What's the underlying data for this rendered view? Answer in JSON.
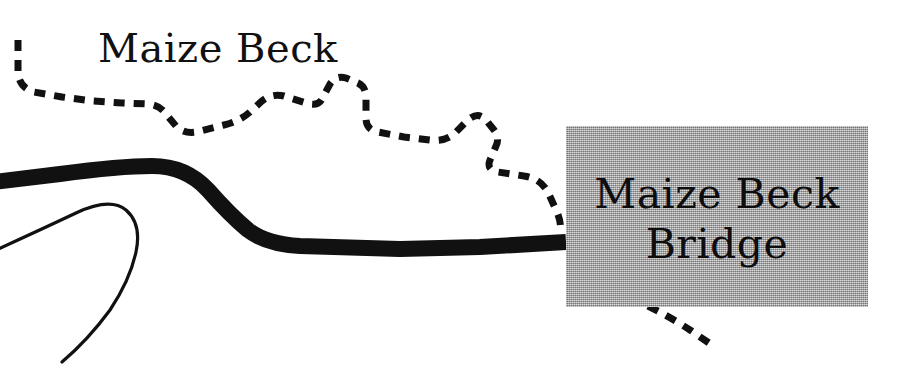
{
  "figure": {
    "name": "maize-beck-bridge-map-detail",
    "width": 918,
    "height": 380,
    "background_color": "#ffffff"
  },
  "labels": {
    "stream_label": "Maize Beck",
    "bridge_label_line1": "Maize Beck",
    "bridge_label_line2": "Bridge"
  },
  "callout_box": {
    "name": "bridge-callout-box",
    "fill_color": "#a9a9a9",
    "x": 566,
    "y": 126,
    "width": 302,
    "height": 181
  },
  "features": [
    {
      "name": "road",
      "style": "thick-solid",
      "color": "#111111",
      "stroke_width": 15
    },
    {
      "name": "stream",
      "style": "dashed",
      "color": "#111111",
      "stroke_width": 7,
      "dash_pattern": "11 9"
    },
    {
      "name": "footpath-loop",
      "style": "thin-solid",
      "color": "#111111",
      "stroke_width": 3
    }
  ]
}
